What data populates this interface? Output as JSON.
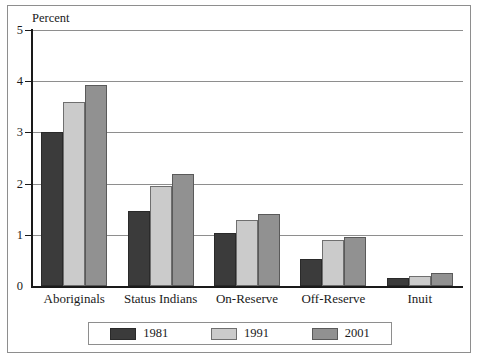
{
  "chart_data": {
    "type": "bar",
    "title": "",
    "subtitle": "",
    "xlabel": "",
    "ylabel": "Percent",
    "ylim": [
      0,
      5
    ],
    "yticks": [
      "0",
      "1",
      "2",
      "3",
      "4",
      "5"
    ],
    "grid": true,
    "grid_orientation": "horizontal",
    "legend_position": "bottom",
    "categories": [
      "Aboriginals",
      "Status Indians",
      "On-Reserve",
      "Off-Reserve",
      "Inuit"
    ],
    "series": [
      {
        "name": "1981",
        "color": "#3b3b3b",
        "values": [
          3.0,
          1.47,
          1.03,
          0.53,
          0.15
        ]
      },
      {
        "name": "1991",
        "color": "#cbcbcb",
        "values": [
          3.6,
          1.96,
          1.28,
          0.9,
          0.2
        ]
      },
      {
        "name": "2001",
        "color": "#919191",
        "values": [
          3.92,
          2.18,
          1.41,
          0.95,
          0.26
        ]
      }
    ]
  },
  "axis": {
    "y_title": "Percent"
  },
  "colors": {
    "frame": "#8e8e8e",
    "axis": "#1a1a1a",
    "gridline": "#8e8e8e",
    "series_1981": "#3b3b3b",
    "series_1991": "#cbcbcb",
    "series_2001": "#919191"
  }
}
